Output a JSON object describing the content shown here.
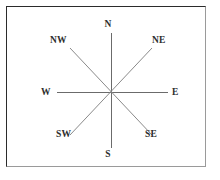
{
  "diagram": {
    "type": "compass-rose",
    "center": {
      "x": 111,
      "y": 92
    },
    "frame": {
      "visible": true,
      "border_color_top_left": "#2b2b2b",
      "border_color_bottom_right": "#9a9a9a"
    },
    "line_color": "#6b6b6b",
    "text_color": "#2e2e2e",
    "background": "#ffffff",
    "directions": [
      {
        "id": "north",
        "label": "N",
        "bearing_degrees": 0,
        "kind": "cardinal",
        "ray": {
          "x1": 111,
          "y1": 92,
          "x2": 111,
          "y2": 33
        }
      },
      {
        "id": "northeast",
        "label": "NE",
        "bearing_degrees": 45,
        "kind": "intercardinal",
        "ray": {
          "x1": 111,
          "y1": 92,
          "x2": 152,
          "y2": 48
        }
      },
      {
        "id": "east",
        "label": "E",
        "bearing_degrees": 90,
        "kind": "cardinal",
        "ray": {
          "x1": 111,
          "y1": 92,
          "x2": 168,
          "y2": 92
        }
      },
      {
        "id": "southeast",
        "label": "SE",
        "bearing_degrees": 135,
        "kind": "intercardinal",
        "ray": {
          "x1": 111,
          "y1": 92,
          "x2": 152,
          "y2": 135
        }
      },
      {
        "id": "south",
        "label": "S",
        "bearing_degrees": 180,
        "kind": "cardinal",
        "ray": {
          "x1": 111,
          "y1": 92,
          "x2": 111,
          "y2": 148
        }
      },
      {
        "id": "southwest",
        "label": "SW",
        "bearing_degrees": 225,
        "kind": "intercardinal",
        "ray": {
          "x1": 111,
          "y1": 92,
          "x2": 70,
          "y2": 135
        }
      },
      {
        "id": "west",
        "label": "W",
        "bearing_degrees": 270,
        "kind": "cardinal",
        "ray": {
          "x1": 111,
          "y1": 92,
          "x2": 57,
          "y2": 92
        }
      },
      {
        "id": "northwest",
        "label": "NW",
        "bearing_degrees": 315,
        "kind": "intercardinal",
        "ray": {
          "x1": 111,
          "y1": 92,
          "x2": 70,
          "y2": 48
        }
      }
    ]
  }
}
